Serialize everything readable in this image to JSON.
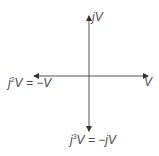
{
  "diagram": {
    "type": "phasor-diagram",
    "line_color": "#555555",
    "text_color": "#4a4a4a",
    "phasors": [
      {
        "id": "v",
        "direction": "right",
        "label": "V"
      },
      {
        "id": "jv",
        "direction": "up",
        "label": "jV"
      },
      {
        "id": "j2v",
        "direction": "left",
        "label_prefix": "j",
        "label_exp": "2",
        "label_suffix": "V = −V"
      },
      {
        "id": "j3v",
        "direction": "down",
        "label_prefix": "j",
        "label_exp": "3",
        "label_suffix": "V = −jV"
      }
    ]
  }
}
